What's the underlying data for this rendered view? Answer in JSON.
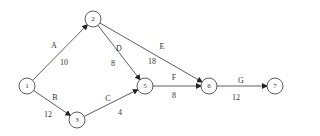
{
  "diagram": {
    "type": "activity-on-arrow network",
    "nodes": [
      {
        "id": "1",
        "label": "1",
        "x": 27,
        "y": 86
      },
      {
        "id": "2",
        "label": "2",
        "x": 93,
        "y": 19
      },
      {
        "id": "3",
        "label": "3",
        "x": 77,
        "y": 120
      },
      {
        "id": "5",
        "label": "5",
        "x": 145,
        "y": 86
      },
      {
        "id": "6",
        "label": "6",
        "x": 209,
        "y": 86
      },
      {
        "id": "7",
        "label": "7",
        "x": 275,
        "y": 86
      }
    ],
    "edges": [
      {
        "from": "1",
        "to": "2",
        "activity": "A",
        "duration": "10",
        "ax": 54,
        "ay": 45,
        "dx": 64,
        "dy": 62
      },
      {
        "from": "1",
        "to": "3",
        "activity": "B",
        "duration": "12",
        "ax": 55,
        "ay": 97,
        "dx": 48,
        "dy": 114
      },
      {
        "from": "3",
        "to": "5",
        "activity": "C",
        "duration": "4",
        "ax": 108,
        "ay": 98,
        "dx": 120,
        "dy": 112
      },
      {
        "from": "2",
        "to": "5",
        "activity": "D",
        "duration": "8",
        "ax": 119,
        "ay": 48,
        "dx": 113,
        "dy": 63
      },
      {
        "from": "2",
        "to": "6",
        "activity": "E",
        "duration": "18",
        "ax": 162,
        "ay": 46,
        "dx": 152,
        "dy": 61
      },
      {
        "from": "5",
        "to": "6",
        "activity": "F",
        "duration": "8",
        "ax": 174,
        "ay": 77,
        "dx": 174,
        "dy": 95
      },
      {
        "from": "6",
        "to": "7",
        "activity": "G",
        "duration": "12",
        "ax": 241,
        "ay": 80,
        "dx": 236,
        "dy": 97
      }
    ]
  }
}
